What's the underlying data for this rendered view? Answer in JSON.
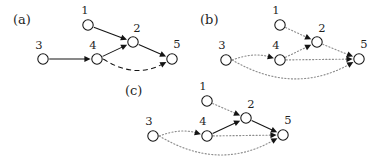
{
  "figure": {
    "background_color": "#ffffff",
    "ink_color": "#141414",
    "dotted_color": "#8d8d8d",
    "width": 378,
    "height": 156,
    "panels": [
      {
        "id": "a",
        "label": "(a)",
        "label_pos": {
          "x": 13,
          "y": 24
        },
        "nodes": [
          {
            "id": "1",
            "label": "1",
            "x": 88,
            "y": 25,
            "r": 5.2,
            "label_pos": {
              "x": 85,
              "y": 14
            }
          },
          {
            "id": "2",
            "label": "2",
            "x": 133,
            "y": 42,
            "r": 5.2,
            "label_pos": {
              "x": 137,
              "y": 32
            }
          },
          {
            "id": "3",
            "label": "3",
            "x": 43,
            "y": 59,
            "r": 5.2,
            "label_pos": {
              "x": 39,
              "y": 49
            }
          },
          {
            "id": "4",
            "label": "4",
            "x": 97,
            "y": 59,
            "r": 5.2,
            "label_pos": {
              "x": 93,
              "y": 49
            }
          },
          {
            "id": "5",
            "label": "5",
            "x": 172,
            "y": 59,
            "r": 5.2,
            "label_pos": {
              "x": 177,
              "y": 48
            }
          }
        ],
        "edges": [
          {
            "from": "1",
            "to": "2",
            "style": "solid",
            "curve": 0,
            "arrow": "single"
          },
          {
            "from": "4",
            "to": "2",
            "style": "solid",
            "curve": 0,
            "arrow": "single"
          },
          {
            "from": "2",
            "to": "5",
            "style": "solid",
            "curve": 0,
            "arrow": "single"
          },
          {
            "from": "3",
            "to": "4",
            "style": "solid",
            "curve": 0,
            "arrow": "single"
          },
          {
            "from": "4",
            "to": "5",
            "style": "dashed",
            "curve": 10,
            "arrow": "single"
          }
        ]
      },
      {
        "id": "b",
        "label": "(b)",
        "label_pos": {
          "x": 200,
          "y": 24
        },
        "nodes": [
          {
            "id": "1",
            "label": "1",
            "x": 280,
            "y": 25,
            "r": 5.2,
            "label_pos": {
              "x": 276,
              "y": 14
            }
          },
          {
            "id": "2",
            "label": "2",
            "x": 317,
            "y": 42,
            "r": 5.2,
            "label_pos": {
              "x": 322,
              "y": 32
            }
          },
          {
            "id": "3",
            "label": "3",
            "x": 226,
            "y": 60,
            "r": 5.2,
            "label_pos": {
              "x": 222,
              "y": 49
            }
          },
          {
            "id": "4",
            "label": "4",
            "x": 280,
            "y": 60,
            "r": 5.2,
            "label_pos": {
              "x": 276,
              "y": 49
            }
          },
          {
            "id": "5",
            "label": "5",
            "x": 359,
            "y": 59,
            "r": 5.2,
            "label_pos": {
              "x": 364,
              "y": 48
            }
          }
        ],
        "edges": [
          {
            "from": "1",
            "to": "2",
            "style": "dotted",
            "curve": 0,
            "arrow": "single"
          },
          {
            "from": "4",
            "to": "2",
            "style": "dotted",
            "curve": 0,
            "arrow": "single"
          },
          {
            "from": "2",
            "to": "5",
            "style": "dotted",
            "curve": 0,
            "arrow": "single"
          },
          {
            "from": "3",
            "to": "4",
            "style": "dotted",
            "curve": -4,
            "arrow": "single"
          },
          {
            "from": "4",
            "to": "5",
            "style": "dotted",
            "curve": 0,
            "arrow": "single"
          },
          {
            "from": "3",
            "to": "5",
            "style": "dotted",
            "curve": 18,
            "arrow": "single"
          }
        ]
      },
      {
        "id": "c",
        "label": "(c)",
        "label_pos": {
          "x": 125,
          "y": 95
        },
        "nodes": [
          {
            "id": "1",
            "label": "1",
            "x": 207,
            "y": 101,
            "r": 5.2,
            "label_pos": {
              "x": 203,
              "y": 90
            }
          },
          {
            "id": "2",
            "label": "2",
            "x": 246,
            "y": 118,
            "r": 5.2,
            "label_pos": {
              "x": 251,
              "y": 108
            }
          },
          {
            "id": "3",
            "label": "3",
            "x": 153,
            "y": 136,
            "r": 5.2,
            "label_pos": {
              "x": 149,
              "y": 125
            }
          },
          {
            "id": "4",
            "label": "4",
            "x": 207,
            "y": 136,
            "r": 5.2,
            "label_pos": {
              "x": 203,
              "y": 125
            }
          },
          {
            "id": "5",
            "label": "5",
            "x": 283,
            "y": 135,
            "r": 5.2,
            "label_pos": {
              "x": 288,
              "y": 124
            }
          }
        ],
        "edges": [
          {
            "from": "1",
            "to": "2",
            "style": "dotted",
            "curve": 0,
            "arrow": "single"
          },
          {
            "from": "4",
            "to": "2",
            "style": "solid",
            "curve": 0,
            "arrow": "single"
          },
          {
            "from": "2",
            "to": "5",
            "style": "solid",
            "curve": 0,
            "arrow": "single"
          },
          {
            "from": "3",
            "to": "4",
            "style": "dotted",
            "curve": -4,
            "arrow": "single"
          },
          {
            "from": "4",
            "to": "5",
            "style": "dotted",
            "curve": 0,
            "arrow": "single"
          },
          {
            "from": "3",
            "to": "5",
            "style": "dotted",
            "curve": 18,
            "arrow": "single"
          }
        ]
      }
    ]
  }
}
